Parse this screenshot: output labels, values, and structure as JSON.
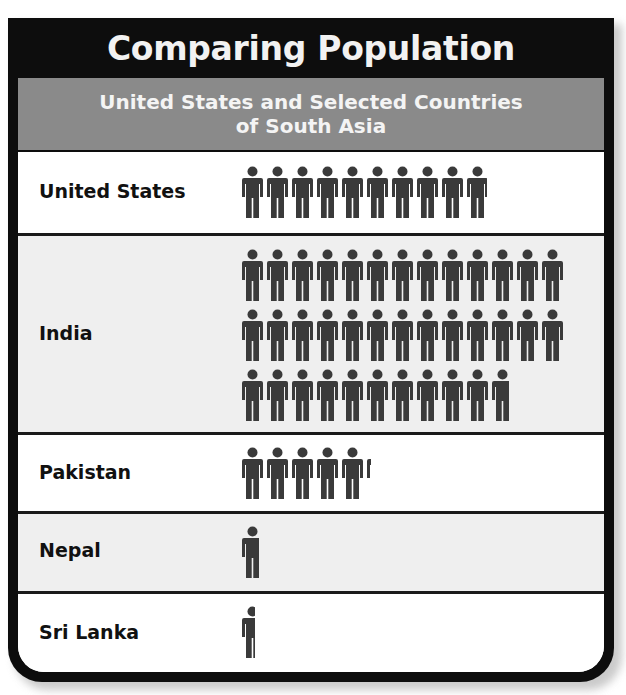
{
  "title": "Comparing Population",
  "subtitle_line1": "United States and Selected Countries",
  "subtitle_line2": "of South Asia",
  "legend": {
    "icon": "person-icon",
    "text": "= 30,000,000",
    "unit_value": 30000000
  },
  "rows": [
    {
      "label": "United States",
      "icons": 9.9
    },
    {
      "label": "India",
      "icons": 36.8
    },
    {
      "label": "Pakistan",
      "icons": 5.2
    },
    {
      "label": "Nepal",
      "icons": 0.8
    },
    {
      "label": "Sri Lanka",
      "icons": 0.6
    }
  ],
  "colors": {
    "frame": "#0d0d0d",
    "subtitle_bg": "#8a8a8a",
    "icon": "#3a3a3a",
    "row_white": "#ffffff",
    "row_gray": "#efefef"
  },
  "chart_data": {
    "type": "bar",
    "subtype": "pictograph",
    "title": "Comparing Population",
    "subtitle": "United States and Selected Countries of South Asia",
    "categories": [
      "United States",
      "India",
      "Pakistan",
      "Nepal",
      "Sri Lanka"
    ],
    "icon_counts": [
      9.9,
      36.8,
      5.2,
      0.8,
      0.6
    ],
    "values": [
      297000000,
      1104000000,
      156000000,
      24000000,
      18000000
    ],
    "unit": "people",
    "legend": "1 person icon = 30,000,000",
    "xlabel": "",
    "ylabel": "",
    "grid": false
  }
}
